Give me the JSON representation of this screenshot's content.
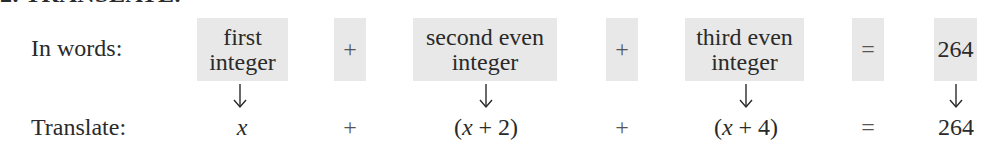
{
  "title": "2. TRANSLATE.",
  "rows": {
    "words_label": "In words:",
    "translate_label": "Translate:"
  },
  "words": [
    {
      "line1": "first",
      "line2": "integer"
    },
    {
      "op": "+"
    },
    {
      "line1": "second even",
      "line2": "integer"
    },
    {
      "op": "+"
    },
    {
      "line1": "third even",
      "line2": "integer"
    },
    {
      "op": "="
    },
    {
      "line1": "264"
    }
  ],
  "translate": [
    {
      "var": "x"
    },
    {
      "op": "+"
    },
    {
      "open": "(",
      "var": "x",
      "plus": "+",
      "num": "2",
      "close": ")"
    },
    {
      "op": "+"
    },
    {
      "open": "(",
      "var": "x",
      "plus": "+",
      "num": "4",
      "close": ")"
    },
    {
      "op": "="
    },
    {
      "value": "264"
    }
  ],
  "colors": {
    "box_fill": "#e8e8e8",
    "text": "#2a2a2a"
  },
  "icons": {
    "arrow": "down-arrow-icon"
  }
}
